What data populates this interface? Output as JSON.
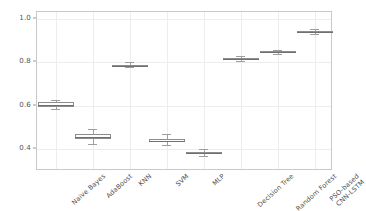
{
  "chart_data": {
    "type": "box",
    "title": "",
    "xlabel": "",
    "ylabel": "",
    "ylim": [
      0.3,
      1.03
    ],
    "yticks": [
      0.4,
      0.6,
      0.8,
      1.0
    ],
    "ytick_labels": [
      "0.4",
      "0.6",
      "0.8",
      "1.0"
    ],
    "grid": true,
    "legend": "none",
    "categories": [
      "Naive Bayes",
      "AdaBoost",
      "KNN",
      "SVM",
      "MLP",
      "Decision Tree",
      "Random Forest",
      "PSO-based CNN-LSTM"
    ],
    "boxes": [
      {
        "label": "Naive Bayes",
        "whisker_low": 0.585,
        "q1": 0.592,
        "median": 0.603,
        "q3": 0.615,
        "whisker_high": 0.628
      },
      {
        "label": "AdaBoost",
        "whisker_low": 0.425,
        "q1": 0.448,
        "median": 0.458,
        "q3": 0.47,
        "whisker_high": 0.492
      },
      {
        "label": "KNN",
        "whisker_low": 0.776,
        "q1": 0.781,
        "median": 0.784,
        "q3": 0.787,
        "whisker_high": 0.802
      },
      {
        "label": "SVM",
        "whisker_low": 0.418,
        "q1": 0.432,
        "median": 0.44,
        "q3": 0.449,
        "whisker_high": 0.47
      },
      {
        "label": "MLP",
        "whisker_low": 0.368,
        "q1": 0.378,
        "median": 0.382,
        "q3": 0.388,
        "whisker_high": 0.402
      },
      {
        "label": "Decision Tree",
        "whisker_low": 0.803,
        "q1": 0.81,
        "median": 0.813,
        "q3": 0.817,
        "whisker_high": 0.826
      },
      {
        "label": "Random Forest",
        "whisker_low": 0.836,
        "q1": 0.842,
        "median": 0.845,
        "q3": 0.849,
        "whisker_high": 0.856
      },
      {
        "label": "PSO-based CNN-LSTM",
        "whisker_low": 0.93,
        "q1": 0.937,
        "median": 0.94,
        "q3": 0.944,
        "whisker_high": 0.952
      }
    ],
    "xtick_labels": [
      {
        "line1": "Naive Bayes",
        "line2": ""
      },
      {
        "line1": "AdaBoost",
        "line2": ""
      },
      {
        "line1": "KNN",
        "line2": ""
      },
      {
        "line1": "SVM",
        "line2": ""
      },
      {
        "line1": "MLP",
        "line2": ""
      },
      {
        "line1": "Decision Tree",
        "line2": ""
      },
      {
        "line1": "Random Forest",
        "line2": ""
      },
      {
        "line1": "PSO-based",
        "line2": "CNN-LSTM"
      }
    ],
    "colors": {
      "box_edge": "#8d8d8d",
      "box_face": "#ffffff",
      "median": "#6f6f6f",
      "whisker": "#9e9e9e",
      "grid": "#ededed",
      "frame": "#c9c9c9",
      "text": "#4f4f4f",
      "background": "#ffffff"
    }
  }
}
